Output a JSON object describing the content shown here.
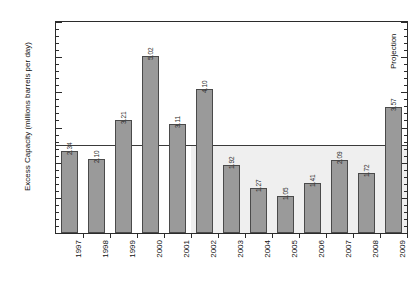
{
  "chart_data": {
    "type": "bar",
    "title": "",
    "subtitle": "",
    "xlabel": "",
    "ylabel": "Excess Capacity (millions barrels per day)",
    "categories": [
      "1997",
      "1998",
      "1999",
      "2000",
      "2001",
      "2002",
      "2003",
      "2004",
      "2005",
      "2006",
      "2007",
      "2008",
      "2009"
    ],
    "values": [
      2.34,
      2.1,
      3.21,
      5.02,
      3.11,
      4.1,
      1.92,
      1.27,
      1.05,
      1.41,
      2.09,
      1.72,
      3.57
    ],
    "value_labels": [
      "2.34",
      "2.10",
      "3.21",
      "5.02",
      "3.11",
      "4.10",
      "1.92",
      "1.27",
      "1.05",
      "1.41",
      "2.09",
      "1.72",
      "3.57"
    ],
    "ylim": [
      0.0,
      6.0
    ],
    "ytick_values": [
      0.0,
      1.0,
      2.0,
      3.0,
      4.0,
      5.0,
      6.0
    ],
    "ytick_labels": [
      "0.0",
      "1.0",
      "2.0",
      "3.0",
      "4.0",
      "5.0",
      "6.0"
    ],
    "yminor_step": 0.2,
    "grid": false,
    "legend": null,
    "legend_position": "none",
    "reference_line": 2.5,
    "shaded_band": {
      "from_category": "2002",
      "to_category": "2009",
      "top_value": 2.5
    },
    "annotations": [
      {
        "text": "Projection",
        "category": "2009",
        "orientation": "vertical"
      }
    ],
    "bar_fill_color": "#9a9a9a",
    "bar_edge_color": "#4a4a4a",
    "axis_color": "#2b2b2b",
    "band_color": "#efefef",
    "background_color": "#ffffff"
  }
}
